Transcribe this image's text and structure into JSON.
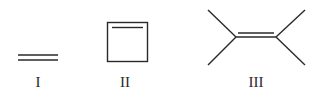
{
  "structures": [
    {
      "id": "I",
      "label": "I",
      "name": "ethylene"
    },
    {
      "id": "II",
      "label": "II",
      "name": "cyclobutene"
    },
    {
      "id": "III",
      "label": "III",
      "name": "tetramethylethylene"
    }
  ],
  "colors": {
    "stroke": "#2a2a2a",
    "background": "#ffffff"
  }
}
